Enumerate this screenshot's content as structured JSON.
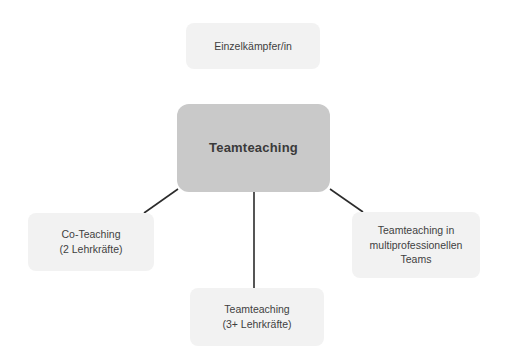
{
  "diagram": {
    "background_color": "#ffffff",
    "center_node": {
      "id": "teamteaching-center",
      "label": "Teamteaching",
      "fill_color": "#c9c9c9",
      "text_color": "#3a3a3a"
    },
    "satellite_nodes": [
      {
        "id": "einzelkaempfer",
        "position": "top",
        "label": "Einzelkämpfer/in",
        "fill_color": "#f2f2f2",
        "text_color": "#3f3f3f"
      },
      {
        "id": "co-teaching",
        "position": "left",
        "label": "Co-Teaching\n(2 Lehrkräfte)",
        "fill_color": "#f2f2f2",
        "text_color": "#3f3f3f"
      },
      {
        "id": "teamteaching-multiprofessionell",
        "position": "right",
        "label": "Teamteaching in\nmultiprofessionellen\nTeams",
        "fill_color": "#f2f2f2",
        "text_color": "#3f3f3f"
      },
      {
        "id": "teamteaching-drei-plus",
        "position": "bottom",
        "label": "Teamteaching\n(3+ Lehrkräfte)",
        "fill_color": "#f2f2f2",
        "text_color": "#3f3f3f"
      }
    ],
    "connectors": [
      {
        "id": "connector-center-to-left",
        "from": "teamteaching-center",
        "to": "co-teaching",
        "style": "diagonal-line",
        "color": "#2b2b2b",
        "x1": 178,
        "y1": 189,
        "x2": 144,
        "y2": 213
      },
      {
        "id": "connector-center-to-right",
        "from": "teamteaching-center",
        "to": "teamteaching-multiprofessionell",
        "style": "diagonal-line",
        "color": "#2b2b2b",
        "x1": 330,
        "y1": 189,
        "x2": 363,
        "y2": 212
      },
      {
        "id": "connector-center-to-bottom",
        "from": "teamteaching-center",
        "to": "teamteaching-drei-plus",
        "style": "vertical-line",
        "color": "#2b2b2b",
        "x1": 254,
        "y1": 192,
        "x2": 254,
        "y2": 288
      }
    ]
  }
}
